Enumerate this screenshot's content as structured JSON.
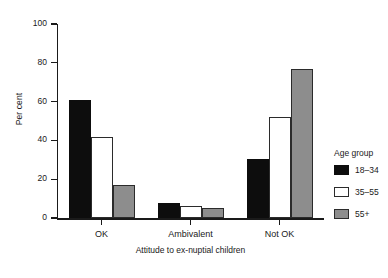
{
  "chart_data": {
    "type": "bar",
    "title": "",
    "categories": [
      "OK",
      "Ambivalent",
      "Not OK"
    ],
    "series": [
      {
        "name": "18–34",
        "color": "#0d0d0d",
        "values": [
          61,
          7.5,
          30.5
        ]
      },
      {
        "name": "35–55",
        "color": "#ffffff",
        "values": [
          42,
          6,
          52
        ]
      },
      {
        "name": "55+",
        "color": "#8d8d8d",
        "values": [
          17,
          5,
          77
        ]
      }
    ],
    "xlabel": "Attitude to ex-nuptial children",
    "ylabel": "Per cent",
    "ylim": [
      0,
      100
    ],
    "yticks": [
      0,
      20,
      40,
      60,
      80,
      100
    ],
    "ytick_labels": [
      "0",
      "20",
      "40",
      "60",
      "80",
      "100"
    ],
    "grid": false,
    "legend_position": "right",
    "legend_title": "Age group"
  }
}
